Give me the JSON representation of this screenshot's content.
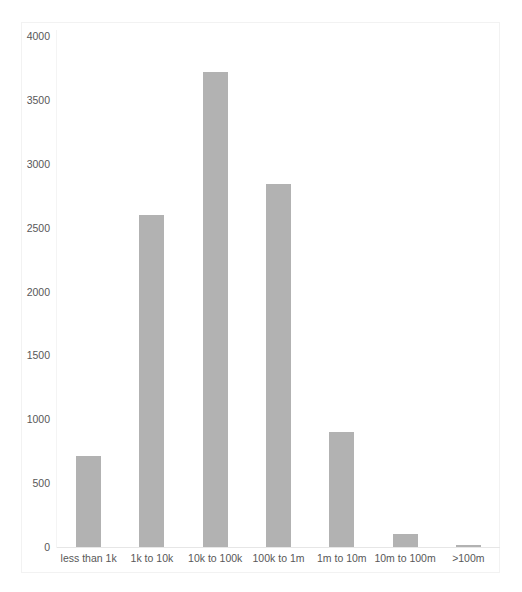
{
  "chart_data": {
    "type": "bar",
    "title": "",
    "subtitle": "",
    "xlabel": "",
    "ylabel": "",
    "categories": [
      "less than 1k",
      "1k to 10k",
      "10k to 100k",
      "100k to 1m",
      "1m to 10m",
      "10m to 100m",
      ">100m"
    ],
    "values": [
      712,
      2598,
      3717,
      2840,
      900,
      102,
      15
    ],
    "series": [
      {
        "name": "count",
        "values": [
          712,
          2598,
          3717,
          2840,
          900,
          102,
          15
        ]
      }
    ],
    "ylim": [
      0,
      4000
    ],
    "y_ticks": [
      0,
      500,
      1000,
      1500,
      2000,
      2500,
      3000,
      3500,
      4000
    ],
    "y_tick_labels": [
      "0",
      "500",
      "1000",
      "1500",
      "2000",
      "2500",
      "3000",
      "3500",
      "4000"
    ],
    "grid": false,
    "legend": false,
    "legend_position": "none",
    "bar_color": "#b2b2b2",
    "axis_label_color": "#585858",
    "axis_line_color": "#e6e6e6",
    "background_color": "#ffffff"
  }
}
